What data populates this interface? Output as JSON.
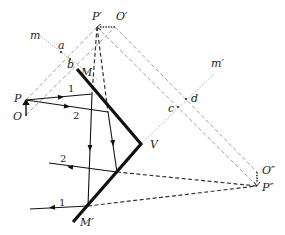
{
  "figure": {
    "type": "optics-ray-diagram",
    "labels": {
      "P_prime": "P′",
      "O_prime": "O′",
      "m": "m",
      "a": "a",
      "b": "b",
      "M": "M",
      "m_prime": "m′",
      "P": "P",
      "O": "O",
      "ray1_in": "1",
      "ray2_in": "2",
      "c": "c",
      "d": "d",
      "V": "V",
      "ray2_out": "2",
      "O_double_prime": "O″",
      "P_double_prime": "P″",
      "ray1_out": "1",
      "M_prime": "M′"
    },
    "colors": {
      "ink": "#222222",
      "construction": "#666666",
      "background": "#ffffff"
    }
  }
}
